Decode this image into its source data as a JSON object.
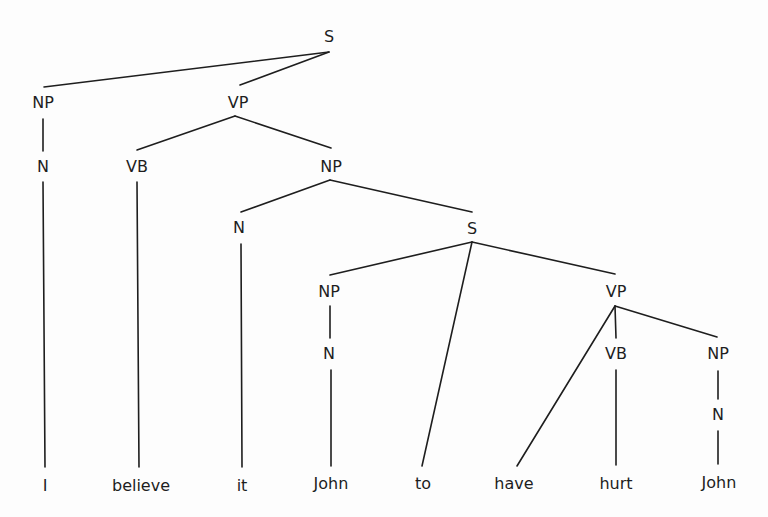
{
  "diagram": {
    "type": "syntax-tree",
    "sentence": [
      "I",
      "believe",
      "it",
      "John",
      "to",
      "have",
      "hurt",
      "John"
    ],
    "nodes": [
      {
        "id": "s_root",
        "label": "S",
        "x": 329,
        "y": 37
      },
      {
        "id": "np_subj",
        "label": "NP",
        "x": 43,
        "y": 103
      },
      {
        "id": "vp_main",
        "label": "VP",
        "x": 238,
        "y": 103
      },
      {
        "id": "n_subj",
        "label": "N",
        "x": 43,
        "y": 167
      },
      {
        "id": "vb_main",
        "label": "VB",
        "x": 137,
        "y": 167
      },
      {
        "id": "np_obj",
        "label": "NP",
        "x": 331,
        "y": 167
      },
      {
        "id": "n_it",
        "label": "N",
        "x": 239,
        "y": 228
      },
      {
        "id": "s_emb",
        "label": "S",
        "x": 472,
        "y": 229
      },
      {
        "id": "np_emb",
        "label": "NP",
        "x": 329,
        "y": 292
      },
      {
        "id": "vp_emb",
        "label": "VP",
        "x": 616,
        "y": 292
      },
      {
        "id": "n_emb",
        "label": "N",
        "x": 329,
        "y": 354
      },
      {
        "id": "vb_emb",
        "label": "VB",
        "x": 616,
        "y": 354
      },
      {
        "id": "np_emb_obj",
        "label": "NP",
        "x": 718,
        "y": 354
      },
      {
        "id": "n_emb_obj",
        "label": "N",
        "x": 718,
        "y": 415
      }
    ],
    "leaves": [
      {
        "id": "w_I",
        "label": "I",
        "x": 45,
        "y": 486
      },
      {
        "id": "w_believe",
        "label": "believe",
        "x": 141,
        "y": 486
      },
      {
        "id": "w_it",
        "label": "it",
        "x": 242,
        "y": 486
      },
      {
        "id": "w_John1",
        "label": "John",
        "x": 331,
        "y": 484
      },
      {
        "id": "w_to",
        "label": "to",
        "x": 423,
        "y": 484
      },
      {
        "id": "w_have",
        "label": "have",
        "x": 514,
        "y": 484
      },
      {
        "id": "w_hurt",
        "label": "hurt",
        "x": 616,
        "y": 484
      },
      {
        "id": "w_John2",
        "label": "John",
        "x": 719,
        "y": 483
      }
    ],
    "edges": [
      {
        "x1": 329,
        "y1": 52,
        "x2": 44,
        "y2": 87
      },
      {
        "x1": 329,
        "y1": 52,
        "x2": 240,
        "y2": 85
      },
      {
        "x1": 43,
        "y1": 119,
        "x2": 43,
        "y2": 151
      },
      {
        "x1": 235,
        "y1": 116,
        "x2": 137,
        "y2": 150
      },
      {
        "x1": 235,
        "y1": 116,
        "x2": 331,
        "y2": 148
      },
      {
        "x1": 43,
        "y1": 182,
        "x2": 45,
        "y2": 467
      },
      {
        "x1": 137,
        "y1": 182,
        "x2": 139,
        "y2": 467
      },
      {
        "x1": 330,
        "y1": 180,
        "x2": 241,
        "y2": 212
      },
      {
        "x1": 330,
        "y1": 180,
        "x2": 472,
        "y2": 212
      },
      {
        "x1": 241,
        "y1": 244,
        "x2": 242,
        "y2": 467
      },
      {
        "x1": 472,
        "y1": 242,
        "x2": 330,
        "y2": 275
      },
      {
        "x1": 472,
        "y1": 242,
        "x2": 615,
        "y2": 274
      },
      {
        "x1": 472,
        "y1": 242,
        "x2": 422,
        "y2": 466
      },
      {
        "x1": 330,
        "y1": 306,
        "x2": 330,
        "y2": 338
      },
      {
        "x1": 331,
        "y1": 370,
        "x2": 331,
        "y2": 466
      },
      {
        "x1": 615,
        "y1": 306,
        "x2": 616,
        "y2": 338
      },
      {
        "x1": 615,
        "y1": 306,
        "x2": 717,
        "y2": 337
      },
      {
        "x1": 615,
        "y1": 306,
        "x2": 517,
        "y2": 466
      },
      {
        "x1": 616,
        "y1": 370,
        "x2": 616,
        "y2": 465
      },
      {
        "x1": 718,
        "y1": 371,
        "x2": 718,
        "y2": 399
      },
      {
        "x1": 718,
        "y1": 431,
        "x2": 718,
        "y2": 464
      }
    ]
  }
}
